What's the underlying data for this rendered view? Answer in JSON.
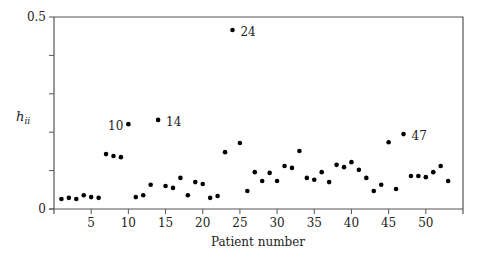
{
  "chart_data": {
    "type": "scatter",
    "title": "",
    "xlabel": "Patient number",
    "ylabel": "h_ii",
    "ylabel_main": "h",
    "ylabel_sub": "ii",
    "xlim": [
      0,
      55
    ],
    "ylim": [
      0,
      0.5
    ],
    "grid": false,
    "legend": null,
    "x_ticks": [
      5,
      10,
      15,
      20,
      25,
      30,
      35,
      40,
      45,
      50
    ],
    "x_tick_labels": [
      "5",
      "10",
      "15",
      "20",
      "25",
      "30",
      "35",
      "40",
      "45",
      "50"
    ],
    "y_ticks": [
      0,
      0.1,
      0.2,
      0.3,
      0.4,
      0.5
    ],
    "y_tick_labels": [
      "0",
      "",
      "",
      "",
      "",
      "0.5"
    ],
    "x": [
      1,
      2,
      3,
      4,
      5,
      6,
      7,
      8,
      9,
      10,
      11,
      12,
      13,
      14,
      15,
      16,
      17,
      18,
      19,
      20,
      21,
      22,
      23,
      24,
      25,
      26,
      27,
      28,
      29,
      30,
      31,
      32,
      33,
      34,
      35,
      36,
      37,
      38,
      39,
      40,
      41,
      42,
      43,
      44,
      45,
      46,
      47,
      48,
      49,
      50,
      51,
      52,
      53
    ],
    "values": [
      0.026,
      0.029,
      0.026,
      0.036,
      0.031,
      0.029,
      0.143,
      0.138,
      0.135,
      0.221,
      0.031,
      0.036,
      0.063,
      0.232,
      0.06,
      0.055,
      0.081,
      0.036,
      0.07,
      0.065,
      0.029,
      0.034,
      0.148,
      0.466,
      0.172,
      0.047,
      0.096,
      0.073,
      0.094,
      0.073,
      0.112,
      0.107,
      0.151,
      0.081,
      0.076,
      0.096,
      0.07,
      0.115,
      0.109,
      0.122,
      0.102,
      0.081,
      0.047,
      0.063,
      0.174,
      0.052,
      0.195,
      0.086,
      0.086,
      0.083,
      0.096,
      0.112,
      0.073
    ],
    "annotations": [
      {
        "text": "10",
        "x": 10,
        "y": 0.221,
        "side": "left"
      },
      {
        "text": "14",
        "x": 14,
        "y": 0.232,
        "side": "right"
      },
      {
        "text": "24",
        "x": 24,
        "y": 0.466,
        "side": "right"
      },
      {
        "text": "47",
        "x": 47,
        "y": 0.195,
        "side": "right"
      }
    ]
  },
  "colors": {
    "axis": "#555555",
    "point": "#000000",
    "text": "#222222"
  }
}
